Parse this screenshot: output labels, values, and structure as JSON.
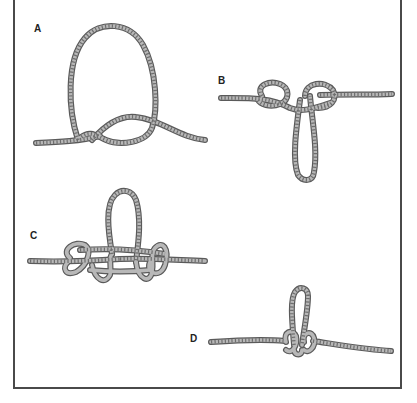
{
  "figure": {
    "steps": [
      {
        "label": "A",
        "description": "Overhand loop formed with working end crossing standing part"
      },
      {
        "label": "B",
        "description": "Two side loops with a center loop hanging down"
      },
      {
        "label": "C",
        "description": "Center loop pulled up with side loops wrapped around standing line"
      },
      {
        "label": "D",
        "description": "Knot tightened and dressed with loop upright"
      }
    ],
    "colors": {
      "rope_outline": "#5a5a5a",
      "rope_fill": "#b8b8b8",
      "frame": "#4a4a4a",
      "background": "#ffffff"
    }
  }
}
